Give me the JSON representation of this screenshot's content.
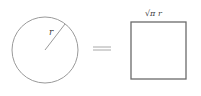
{
  "diagram": {
    "circle": {
      "radius_label": "r"
    },
    "relation": {
      "symbol": "="
    },
    "square": {
      "side_label": "√π r"
    },
    "colors": {
      "circle_stroke": "#9a9a9a",
      "square_stroke": "#6a6a6a",
      "equals_stroke": "#a8a8a8",
      "label": "#444444"
    }
  }
}
